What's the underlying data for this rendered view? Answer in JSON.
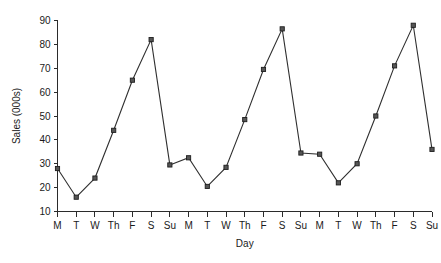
{
  "chart_data": {
    "type": "line",
    "title": "",
    "subtitle": "",
    "xlabel": "Day",
    "ylabel": "Sales (000s)",
    "categories": [
      "M",
      "T",
      "W",
      "Th",
      "F",
      "S",
      "Su",
      "M",
      "T",
      "W",
      "Th",
      "F",
      "S",
      "Su",
      "M",
      "T",
      "W",
      "Th",
      "F",
      "S",
      "Su"
    ],
    "values": [
      28,
      16,
      24,
      44,
      65,
      82,
      29.5,
      32.5,
      20.5,
      28.5,
      48.5,
      69.5,
      86.5,
      34.5,
      34,
      22,
      30,
      50,
      71,
      88,
      36
    ],
    "series": [
      {
        "name": "Sales",
        "values": [
          28,
          16,
          24,
          44,
          65,
          82,
          29.5,
          32.5,
          20.5,
          28.5,
          48.5,
          69.5,
          86.5,
          34.5,
          34,
          22,
          30,
          50,
          71,
          88,
          36
        ]
      }
    ],
    "ylim": [
      10,
      90
    ],
    "yticks": [
      10,
      20,
      30,
      40,
      50,
      60,
      70,
      80,
      90
    ],
    "ytick_labels": [
      "10",
      "20",
      "30",
      "40",
      "50",
      "60",
      "70",
      "80",
      "90"
    ],
    "grid": false,
    "legend": false,
    "legend_position": "none",
    "marker": "square",
    "line_color": "#2f2f2f",
    "marker_color": "#555555",
    "axis_color": "#2b2b2b"
  }
}
